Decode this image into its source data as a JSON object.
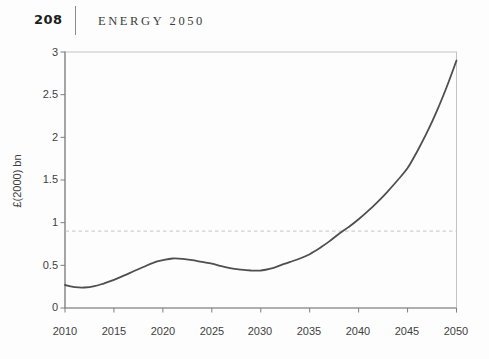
{
  "page": {
    "number": "208",
    "running_head": "ENERGY 2050"
  },
  "chart": {
    "y_axis_label": "£(2000) bn",
    "y_tick_labels": [
      "3",
      "2.5",
      "2",
      "1.5",
      "1",
      "0.5",
      "0"
    ],
    "x_tick_labels": [
      "2010",
      "2015",
      "2020",
      "2025",
      "2030",
      "2035",
      "2040",
      "2045",
      "2050"
    ]
  },
  "chart_data": {
    "type": "line",
    "title": "",
    "xlabel": "",
    "ylabel": "£(2000) bn",
    "xlim": [
      2010,
      2050
    ],
    "ylim": [
      0,
      3
    ],
    "x_ticks": [
      2010,
      2015,
      2020,
      2025,
      2030,
      2035,
      2040,
      2045,
      2050
    ],
    "y_ticks": [
      0,
      0.5,
      1,
      1.5,
      2,
      2.5,
      3
    ],
    "grid": false,
    "legend": false,
    "series": [
      {
        "name": "projected cost",
        "color": "#4f4f4f",
        "style": "solid",
        "x": [
          2010,
          2011,
          2012,
          2013,
          2014,
          2015,
          2016,
          2017,
          2018,
          2019,
          2020,
          2021,
          2022,
          2023,
          2024,
          2025,
          2026,
          2027,
          2028,
          2029,
          2030,
          2031,
          2032,
          2033,
          2034,
          2035,
          2036,
          2037,
          2038,
          2039,
          2040,
          2041,
          2042,
          2043,
          2044,
          2045,
          2046,
          2047,
          2048,
          2049,
          2050
        ],
        "y": [
          0.27,
          0.245,
          0.24,
          0.255,
          0.29,
          0.33,
          0.38,
          0.43,
          0.48,
          0.53,
          0.56,
          0.58,
          0.575,
          0.56,
          0.54,
          0.52,
          0.49,
          0.465,
          0.45,
          0.44,
          0.44,
          0.46,
          0.5,
          0.54,
          0.58,
          0.63,
          0.7,
          0.78,
          0.87,
          0.95,
          1.04,
          1.14,
          1.25,
          1.37,
          1.5,
          1.64,
          1.84,
          2.06,
          2.31,
          2.59,
          2.9
        ]
      }
    ],
    "reference_line": {
      "value": 0.9,
      "style": "dashed",
      "color": "#cbd1ca"
    }
  },
  "colors": {
    "axis": "#7f7f7f",
    "plot_border": "#c3c3c3",
    "text": "#3f3f3f",
    "curve": "#4f4f4f",
    "dashed": "#cbd1ca"
  }
}
